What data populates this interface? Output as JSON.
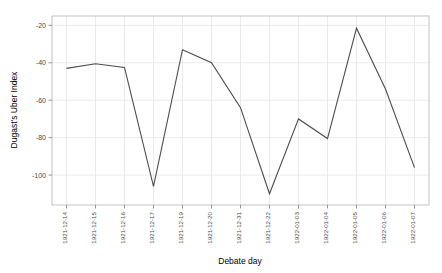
{
  "chart_data": {
    "type": "line",
    "title": "",
    "xlabel": "Debate day",
    "ylabel": "Dugast's Uber Index",
    "categories": [
      "1921-12-14",
      "1921-12-15",
      "1921-12-16",
      "1921-12-17",
      "1921-12-19",
      "1921-12-20",
      "1921-12-31",
      "1921-12-22",
      "1922-01-03",
      "1922-01-04",
      "1922-01-05",
      "1922-01-06",
      "1922-01-07"
    ],
    "values": [
      -43,
      -40.5,
      -42.5,
      -106,
      -33,
      -40,
      -64,
      -110,
      -70,
      -80.5,
      -21.5,
      -54,
      -96
    ],
    "series": [
      {
        "name": "Dugast's Uber Index",
        "values": [
          -43,
          -40.5,
          -42.5,
          -106,
          -33,
          -40,
          -64,
          -110,
          -70,
          -80.5,
          -21.5,
          -54,
          -96
        ]
      }
    ],
    "ylim": [
      -116,
      -15
    ],
    "yticks": [
      -20,
      -40,
      -60,
      -80,
      -100
    ],
    "ytick_labels": [
      "-20",
      "-40",
      "-60",
      "-80",
      "-100"
    ],
    "grid": true,
    "legend": "none",
    "line_color": "#4d4d4d",
    "grid_color": "#e3e3e3",
    "axis_color": "#808080",
    "background": "#ffffff"
  }
}
